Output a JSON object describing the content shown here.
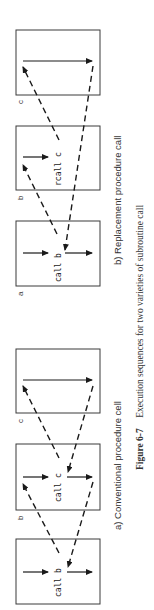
{
  "figure": {
    "number": "Figure 6-7",
    "caption": "Execution sequences for two varieties of subroutine call"
  },
  "panels": [
    {
      "id": "a",
      "caption": "a) Conventional procedure cell",
      "boxes": [
        {
          "label": "a",
          "call_text": "call b"
        },
        {
          "label": "b",
          "call_text": "call c"
        },
        {
          "label": "c",
          "call_text": ""
        }
      ]
    },
    {
      "id": "b",
      "caption": "b) Replacement procedure call",
      "boxes": [
        {
          "label": "a",
          "call_text": "call b"
        },
        {
          "label": "b",
          "call_text": "rcall c"
        },
        {
          "label": "c",
          "call_text": ""
        }
      ]
    }
  ],
  "colors": {
    "line": "#1a1a1a",
    "box": "#3a3a3a",
    "text": "#333333",
    "background": "#ffffff"
  }
}
